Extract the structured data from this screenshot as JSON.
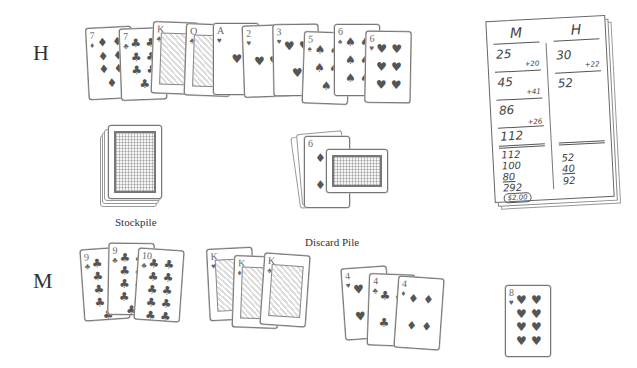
{
  "players": {
    "top_label": "H",
    "bottom_label": "M"
  },
  "hand_h": [
    {
      "rank": "7",
      "suit": "♦",
      "x": 87,
      "y": 27,
      "rot": -3,
      "face": false
    },
    {
      "rank": "7",
      "suit": "♣",
      "x": 120,
      "y": 28,
      "rot": -2,
      "face": false
    },
    {
      "rank": "K",
      "suit": "♣",
      "x": 152,
      "y": 22,
      "rot": 2,
      "face": true
    },
    {
      "rank": "Q",
      "suit": "♣",
      "x": 185,
      "y": 24,
      "rot": 2,
      "face": true
    },
    {
      "rank": "A",
      "suit": "♥",
      "x": 213,
      "y": 23,
      "rot": 0,
      "face": false
    },
    {
      "rank": "2",
      "suit": "♥",
      "x": 243,
      "y": 25,
      "rot": -2,
      "face": false
    },
    {
      "rank": "3",
      "suit": "♥",
      "x": 273,
      "y": 24,
      "rot": -1,
      "face": false
    },
    {
      "rank": "5",
      "suit": "♠",
      "x": 303,
      "y": 32,
      "rot": 2,
      "face": false
    },
    {
      "rank": "6",
      "suit": "♠",
      "x": 334,
      "y": 24,
      "rot": 0,
      "face": false
    },
    {
      "rank": "6",
      "suit": "♥",
      "x": 365,
      "y": 31,
      "rot": 1,
      "face": false
    }
  ],
  "stockpile": {
    "label": "Stockpile"
  },
  "discard_pile": {
    "label": "Discard Pile",
    "top_card": {
      "rank": "6",
      "suit": "♦"
    }
  },
  "hand_m_groups": [
    {
      "name": "nines-tens-clubs",
      "cards": [
        {
          "rank": "9",
          "suit": "♣",
          "x": 82,
          "y": 248,
          "rot": -4
        },
        {
          "rank": "9",
          "suit": "♣",
          "x": 108,
          "y": 243,
          "rot": 1
        },
        {
          "rank": "10",
          "suit": "♣",
          "x": 136,
          "y": 249,
          "rot": 4
        }
      ]
    },
    {
      "name": "kings",
      "cards": [
        {
          "rank": "K",
          "suit": "♥",
          "x": 208,
          "y": 248,
          "rot": -3
        },
        {
          "rank": "K",
          "suit": "♦",
          "x": 233,
          "y": 256,
          "rot": 2
        },
        {
          "rank": "K",
          "suit": "♠",
          "x": 262,
          "y": 254,
          "rot": 4
        }
      ]
    },
    {
      "name": "fours",
      "cards": [
        {
          "rank": "4",
          "suit": "♥",
          "x": 343,
          "y": 267,
          "rot": -4
        },
        {
          "rank": "4",
          "suit": "♣",
          "x": 368,
          "y": 274,
          "rot": 2
        },
        {
          "rank": "4",
          "suit": "♦",
          "x": 396,
          "y": 277,
          "rot": 4
        }
      ]
    },
    {
      "name": "single",
      "cards": [
        {
          "rank": "8",
          "suit": "♥",
          "x": 505,
          "y": 285,
          "rot": 0
        }
      ]
    }
  ],
  "score_pad": {
    "col_m_header": "M",
    "col_h_header": "H",
    "col_m": [
      "25",
      "45",
      "86",
      "112"
    ],
    "col_m_adds": [
      "+20",
      "+41",
      "+26"
    ],
    "col_h": [
      "30",
      "52"
    ],
    "col_h_adds": [
      "+22"
    ],
    "tally_m": [
      "112",
      "100",
      "80",
      "292"
    ],
    "tally_h": [
      "52",
      "40",
      "92"
    ],
    "payout": "$2.00"
  }
}
